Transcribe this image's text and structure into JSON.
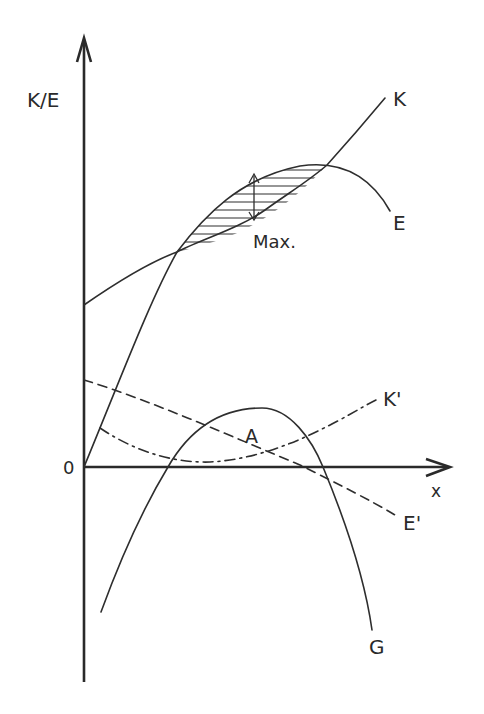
{
  "diagram": {
    "y_axis_label": "K/E",
    "x_axis_label": "x",
    "origin_label": "0",
    "colors": {
      "ink": "#2e2e2e",
      "background": "#ffffff"
    },
    "curves": [
      {
        "id": "K",
        "label": "K",
        "style": "solid",
        "description": "Cost curve rising from origin, S-shaped"
      },
      {
        "id": "E",
        "label": "E",
        "style": "solid",
        "description": "Revenue curve, concave, peaking then falling"
      },
      {
        "id": "K_prime",
        "label": "K'",
        "style": "dash-dot",
        "description": "Marginal cost, U-shaped"
      },
      {
        "id": "E_prime",
        "label": "E'",
        "style": "dashed",
        "description": "Marginal revenue, declining"
      },
      {
        "id": "G",
        "label": "G",
        "style": "solid",
        "description": "Profit curve, inverted parabola"
      }
    ],
    "annotations": {
      "max_label": "Max.",
      "area_label": "A"
    }
  }
}
